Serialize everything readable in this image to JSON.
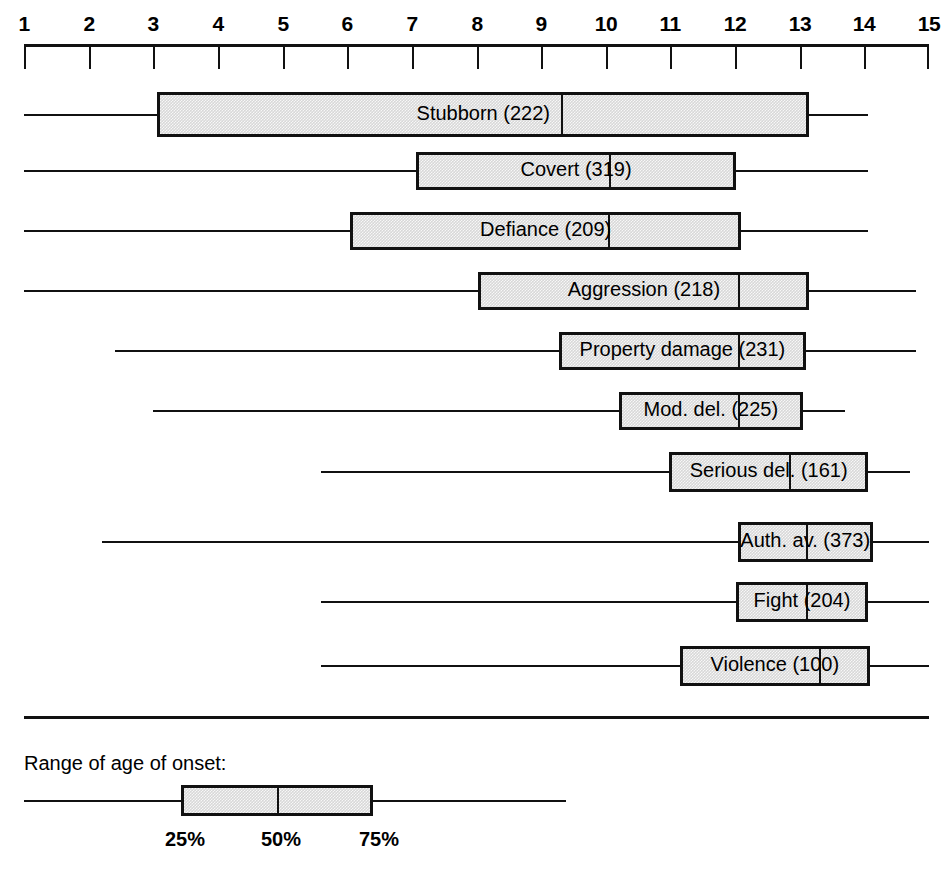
{
  "chart_data": {
    "type": "box",
    "title": "",
    "xlabel": "",
    "ylabel": "",
    "xlim": [
      1,
      15
    ],
    "grid": false,
    "axis_ticks": [
      1,
      2,
      3,
      4,
      5,
      6,
      7,
      8,
      9,
      10,
      11,
      12,
      13,
      14,
      15
    ],
    "axis_tick_labels": [
      "1",
      "2",
      "3",
      "4",
      "5",
      "6",
      "7",
      "8",
      "9",
      "10",
      "11",
      "12",
      "13",
      "14",
      "15"
    ],
    "categories": [
      "Stubborn",
      "Covert",
      "Defiance",
      "Aggression",
      "Property damage",
      "Mod. del.",
      "Serious del.",
      "Auth. av.",
      "Fight",
      "Violence"
    ],
    "boxes": [
      {
        "label": "Stubborn (222)",
        "name": "Stubborn",
        "n": 222,
        "whisker_low": 1.0,
        "q1": 3.06,
        "median": 9.3,
        "q3": 13.15,
        "whisker_high": 14.05
      },
      {
        "label": "Covert (319)",
        "name": "Covert",
        "n": 319,
        "whisker_low": 1.0,
        "q1": 7.06,
        "median": 10.05,
        "q3": 12.02,
        "whisker_high": 14.05
      },
      {
        "label": "Defiance (209)",
        "name": "Defiance",
        "n": 209,
        "whisker_low": 1.0,
        "q1": 6.05,
        "median": 10.03,
        "q3": 12.09,
        "whisker_high": 14.05
      },
      {
        "label": "Aggression (218)",
        "name": "Aggression",
        "n": 218,
        "whisker_low": 1.0,
        "q1": 8.03,
        "median": 12.05,
        "q3": 13.15,
        "whisker_high": 14.8
      },
      {
        "label": "Property damage (231)",
        "name": "Property damage",
        "n": 231,
        "whisker_low": 2.4,
        "q1": 9.27,
        "median": 12.05,
        "q3": 13.1,
        "whisker_high": 14.8
      },
      {
        "label": "Mod. del. (225)",
        "name": "Mod. del.",
        "n": 225,
        "whisker_low": 3.0,
        "q1": 10.2,
        "median": 12.05,
        "q3": 13.05,
        "whisker_high": 13.7
      },
      {
        "label": "Serious del. (161)",
        "name": "Serious del.",
        "n": 161,
        "whisker_low": 5.6,
        "q1": 10.98,
        "median": 12.83,
        "q3": 14.06,
        "whisker_high": 14.7
      },
      {
        "label": "Auth. av. (373)",
        "name": "Auth. av.",
        "n": 373,
        "whisker_low": 2.2,
        "q1": 12.04,
        "median": 13.1,
        "q3": 14.13,
        "whisker_high": 15.0
      },
      {
        "label": "Fight (204)",
        "name": "Fight",
        "n": 204,
        "whisker_low": 5.6,
        "q1": 12.01,
        "median": 13.1,
        "q3": 14.06,
        "whisker_high": 15.0
      },
      {
        "label": "Violence (100)",
        "name": "Violence",
        "n": 100,
        "whisker_low": 5.6,
        "q1": 11.15,
        "median": 13.3,
        "q3": 14.08,
        "whisker_high": 15.0
      }
    ],
    "baseline": {
      "from": 1.0,
      "to": 15.0
    }
  },
  "legend": {
    "title": "Range of age of onset:",
    "whisker_low_label": "",
    "ticks": [
      {
        "label": "25%"
      },
      {
        "label": "50%"
      },
      {
        "label": "75%"
      }
    ]
  },
  "colors": {
    "ink": "#111111",
    "box_fill": "#d8d8d8",
    "background": "#ffffff"
  }
}
